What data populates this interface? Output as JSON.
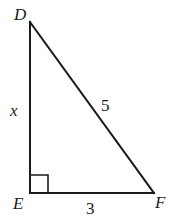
{
  "diagram": {
    "type": "right-triangle",
    "vertices": {
      "D": {
        "label": "D",
        "x": 30,
        "y": 22
      },
      "E": {
        "label": "E",
        "x": 30,
        "y": 193
      },
      "F": {
        "label": "F",
        "x": 154,
        "y": 193
      }
    },
    "right_angle_at": "E",
    "sides": {
      "DE": {
        "label": "x"
      },
      "DF": {
        "label": "5"
      },
      "EF": {
        "label": "3"
      }
    },
    "colors": {
      "stroke": "#1a1a1a",
      "background": "#ffffff"
    }
  }
}
